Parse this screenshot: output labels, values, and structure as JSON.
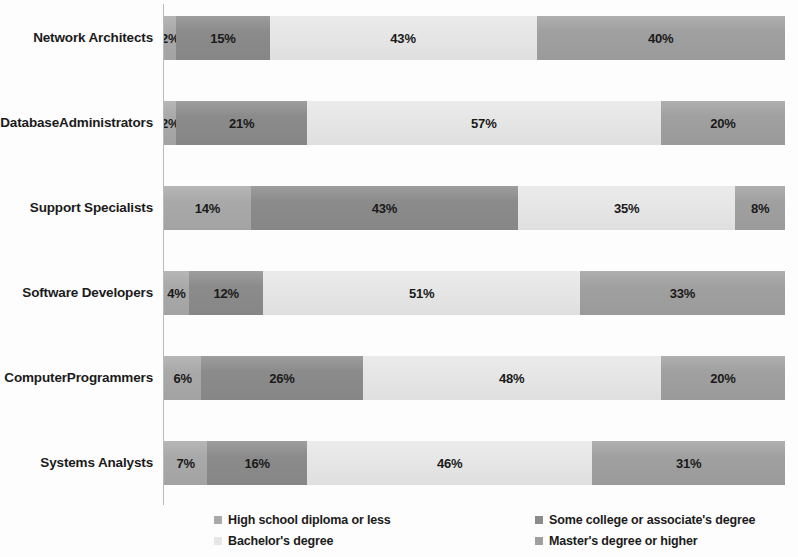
{
  "chart_data": {
    "type": "bar",
    "subtype": "horizontal-100-percent-stacked",
    "title": "",
    "xlabel": "",
    "ylabel": "",
    "xlim": [
      0,
      100
    ],
    "grid": false,
    "legend_position": "bottom",
    "value_suffix": "%",
    "categories": [
      "Network Architects",
      "Database Administrators",
      "Support Specialists",
      "Software Developers",
      "Computer Programmers",
      "Systems Analysts"
    ],
    "series": [
      {
        "name": "High school diploma or less",
        "color": "#a9a9a9",
        "values": [
          2,
          2,
          14,
          4,
          6,
          7
        ]
      },
      {
        "name": "Some college or associate's degree",
        "color": "#8b8b8b",
        "values": [
          15,
          21,
          43,
          12,
          26,
          16
        ]
      },
      {
        "name": "Bachelor's degree",
        "color": "#e7e7e7",
        "values": [
          43,
          57,
          35,
          51,
          48,
          46
        ]
      },
      {
        "name": "Master's degree or higher",
        "color": "#a0a0a0",
        "values": [
          40,
          20,
          8,
          33,
          20,
          31
        ]
      }
    ],
    "rows": [
      {
        "label_lines": [
          "Network Architects"
        ],
        "segments": [
          {
            "label": "2%",
            "value": 2,
            "series": "High school diploma or less"
          },
          {
            "label": "15%",
            "value": 15,
            "series": "Some college or associate's degree"
          },
          {
            "label": "43%",
            "value": 43,
            "series": "Bachelor's degree"
          },
          {
            "label": "40%",
            "value": 40,
            "series": "Master's degree or higher"
          }
        ]
      },
      {
        "label_lines": [
          "Database",
          "Administrators"
        ],
        "segments": [
          {
            "label": "2%",
            "value": 2,
            "series": "High school diploma or less"
          },
          {
            "label": "21%",
            "value": 21,
            "series": "Some college or associate's degree"
          },
          {
            "label": "57%",
            "value": 57,
            "series": "Bachelor's degree"
          },
          {
            "label": "20%",
            "value": 20,
            "series": "Master's degree or higher"
          }
        ]
      },
      {
        "label_lines": [
          "Support Specialists"
        ],
        "segments": [
          {
            "label": "14%",
            "value": 14,
            "series": "High school diploma or less"
          },
          {
            "label": "43%",
            "value": 43,
            "series": "Some college or associate's degree"
          },
          {
            "label": "35%",
            "value": 35,
            "series": "Bachelor's degree"
          },
          {
            "label": "8%",
            "value": 8,
            "series": "Master's degree or higher"
          }
        ]
      },
      {
        "label_lines": [
          "Software Developers"
        ],
        "segments": [
          {
            "label": "4%",
            "value": 4,
            "series": "High school diploma or less"
          },
          {
            "label": "12%",
            "value": 12,
            "series": "Some college or associate's degree"
          },
          {
            "label": "51%",
            "value": 51,
            "series": "Bachelor's degree"
          },
          {
            "label": "33%",
            "value": 33,
            "series": "Master's degree or higher"
          }
        ]
      },
      {
        "label_lines": [
          "Computer",
          "Programmers"
        ],
        "segments": [
          {
            "label": "6%",
            "value": 6,
            "series": "High school diploma or less"
          },
          {
            "label": "26%",
            "value": 26,
            "series": "Some college or associate's degree"
          },
          {
            "label": "48%",
            "value": 48,
            "series": "Bachelor's degree"
          },
          {
            "label": "20%",
            "value": 20,
            "series": "Master's degree or higher"
          }
        ]
      },
      {
        "label_lines": [
          "Systems Analysts"
        ],
        "segments": [
          {
            "label": "7%",
            "value": 7,
            "series": "High school diploma or less"
          },
          {
            "label": "16%",
            "value": 16,
            "series": "Some college or associate's degree"
          },
          {
            "label": "46%",
            "value": 46,
            "series": "Bachelor's degree"
          },
          {
            "label": "31%",
            "value": 31,
            "series": "Master's degree or higher"
          }
        ]
      }
    ],
    "legend": [
      {
        "label": "High school diploma or less",
        "color": "#a9a9a9",
        "column": "left",
        "row": "top"
      },
      {
        "label": "Some college or associate's degree",
        "color": "#8b8b8b",
        "column": "right",
        "row": "top"
      },
      {
        "label": "Bachelor's degree",
        "color": "#e7e7e7",
        "column": "left",
        "row": "bottom"
      },
      {
        "label": "Master's degree or higher",
        "color": "#a0a0a0",
        "column": "right",
        "row": "bottom"
      }
    ]
  }
}
